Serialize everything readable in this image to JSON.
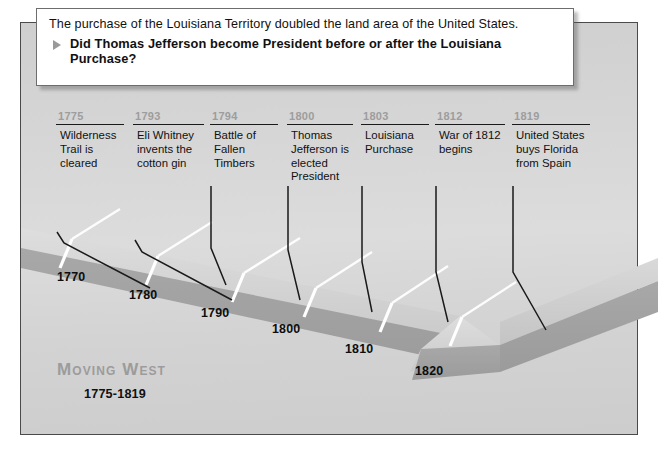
{
  "callout": {
    "lead": "The purchase of the Louisiana Territory doubled the land area of the United States.",
    "bullet_icon": "triangle-right-icon",
    "question": "Did Thomas Jefferson become President before or after the Louisiana Purchase?"
  },
  "title": {
    "heading": "Moving West",
    "range": "1775-1819"
  },
  "events": [
    {
      "year": "1775",
      "text": "Wilderness Trail is cleared"
    },
    {
      "year": "1793",
      "text": "Eli Whitney invents the cotton gin"
    },
    {
      "year": "1794",
      "text": "Battle of Fallen Timbers"
    },
    {
      "year": "1800",
      "text": "Thomas Jefferson is elected President"
    },
    {
      "year": "1803",
      "text": "Louisiana Purchase"
    },
    {
      "year": "1812",
      "text": "War of 1812 begins"
    },
    {
      "year": "1819",
      "text": "United States buys Florida from Spain"
    }
  ],
  "decades": [
    "1770",
    "1780",
    "1790",
    "1800",
    "1810",
    "1820"
  ],
  "colors": {
    "panel_light": "#dcdcdc",
    "band_top": "#d2d2d2",
    "band_edge": "#a2a2a2",
    "tick": "#ffffff",
    "year_label": "#9d9d9d",
    "title": "#9c9c9c",
    "ink": "#111111"
  }
}
